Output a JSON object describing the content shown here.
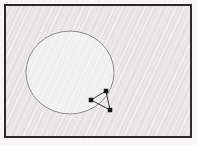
{
  "figure": {
    "background_color": "#f8f7f4",
    "frame": {
      "x": 4,
      "y": 4,
      "width": 188,
      "height": 134,
      "border_width": 2,
      "border_color": "#2c2b29",
      "fill_color": "#e9e8e4"
    },
    "circle": {
      "cx": 70,
      "cy": 72.5,
      "rx": 44,
      "ry": 41.5,
      "stroke_color": "#8f8c87",
      "stroke_width": 1,
      "fill_color": "rgba(250,249,246,0.5)"
    },
    "markers": {
      "shape": "square",
      "size": 4.5,
      "color": "#171717",
      "points": [
        {
          "x": 106,
          "y": 91
        },
        {
          "x": 91,
          "y": 100
        },
        {
          "x": 110,
          "y": 110
        }
      ]
    },
    "edges": {
      "stroke_color": "#3d3b37",
      "stroke_width": 1,
      "pairs": [
        [
          0,
          1
        ],
        [
          1,
          2
        ],
        [
          0,
          2
        ]
      ]
    }
  }
}
